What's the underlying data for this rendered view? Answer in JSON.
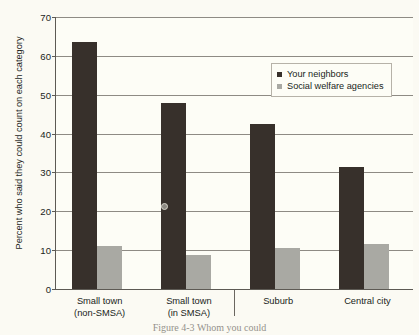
{
  "chart_data": {
    "type": "bar",
    "title": "",
    "xlabel": "",
    "ylabel": "Percent who said they could count on each category",
    "ylim": [
      0,
      70
    ],
    "ytick_step": 10,
    "yticks": [
      0,
      10,
      20,
      30,
      40,
      50,
      60,
      70
    ],
    "grid": true,
    "legend_position": "upper-right-inside",
    "categories": [
      "Small town\n(non-SMSA)",
      "Small town\n(in SMSA)",
      "Suburb",
      "Central city"
    ],
    "category_lines": [
      [
        "Small town",
        "(non-SMSA)"
      ],
      [
        "Small town",
        "(in SMSA)"
      ],
      [
        "Suburb",
        ""
      ],
      [
        "Central city",
        ""
      ]
    ],
    "series": [
      {
        "name": "Your neighbors",
        "color": "#37302b",
        "values": [
          63.5,
          47.8,
          42.5,
          31.5
        ]
      },
      {
        "name": "Social welfare agencies",
        "color": "#a9a9a3",
        "values": [
          11.0,
          8.7,
          10.5,
          11.5
        ]
      }
    ]
  },
  "axis": {
    "y_title": "Percent who said they could count on each category",
    "tick_labels": [
      "70",
      "60",
      "50",
      "40",
      "30",
      "20",
      "10",
      "0"
    ]
  },
  "legend": {
    "items": [
      {
        "label": "Your neighbors",
        "swatch": "dark-square-icon"
      },
      {
        "label": "Social welfare agencies",
        "swatch": "light-square-icon"
      }
    ]
  },
  "caption": "Figure 4-3  Whom you could",
  "colors": {
    "series_dark": "#37302b",
    "series_light": "#a9a9a3",
    "axis": "#5d5a54",
    "grid": "#8e8b84",
    "background": "#fbfaf3"
  }
}
